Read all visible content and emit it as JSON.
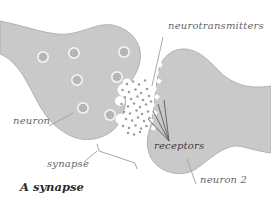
{
  "figure": {
    "type": "labeled-diagram",
    "caption": "A synapse",
    "labels": {
      "neurotransmitters": "neurotransmitters",
      "neuron": "neuron",
      "synapse": "synapse",
      "receptors": "receptors",
      "neuron2": "neuron 2"
    },
    "visible_parts": {
      "vesicle_count": 7,
      "presynaptic_neuron": "left gray cell with dotted vesicles",
      "postsynaptic_neuron": "right gray cell with notched receptor edge",
      "cleft_contents": "scattered neurotransmitter dots"
    }
  },
  "colors": {
    "background": "#ffffff",
    "cell_body": "#cbcbcb",
    "cell_texture_dot": "#bfbfbf",
    "cell_outline": "#b2b2b2",
    "vesicle_ring": "#f2f2f2",
    "vesicle_fill": "#bdbdbd",
    "vesicle_dot": "#949494",
    "neurotransmitter_dot": "#9c9c9c",
    "pointer_line": "#9e9e9e",
    "receptor_pointer_line": "#5a5a5a",
    "label_text": "#666666",
    "receptors_text": "#3c3c3c",
    "caption_text": "#2b2b2b"
  }
}
